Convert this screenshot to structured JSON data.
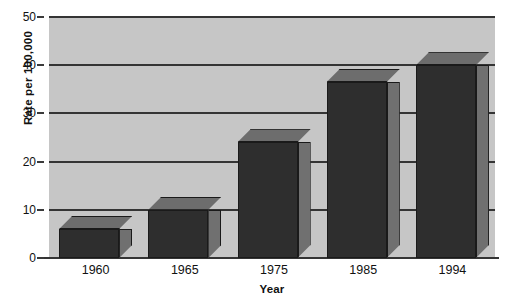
{
  "chart_data": {
    "type": "bar",
    "title": "",
    "subtitle": "",
    "xlabel": "Year",
    "ylabel": "Rate per 100,000",
    "categories": [
      "1960",
      "1965",
      "1975",
      "1985",
      "1994"
    ],
    "values": [
      6,
      10,
      24,
      36.5,
      40
    ],
    "series": [
      {
        "name": "Rate per 100,000",
        "values": [
          6,
          10,
          24,
          36.5,
          40
        ]
      }
    ],
    "ylim": [
      0,
      50
    ],
    "yticks": [
      0,
      10,
      20,
      30,
      40,
      50
    ],
    "ytick_labels": [
      "0",
      "10",
      "20",
      "30",
      "40",
      "50"
    ],
    "grid": true,
    "legend": false,
    "legend_position": "none",
    "style": {
      "plot_background": "#c6c6c6",
      "page_background": "#ffffff",
      "gridline_color": "#343434",
      "bar_front_color": "#2e2e2e",
      "bar_top_color": "#6d6d6d",
      "bar_side_color": "#707070",
      "bar_outline_color": "#1a1a1a",
      "text_color": "#111111",
      "three_d": true
    }
  }
}
